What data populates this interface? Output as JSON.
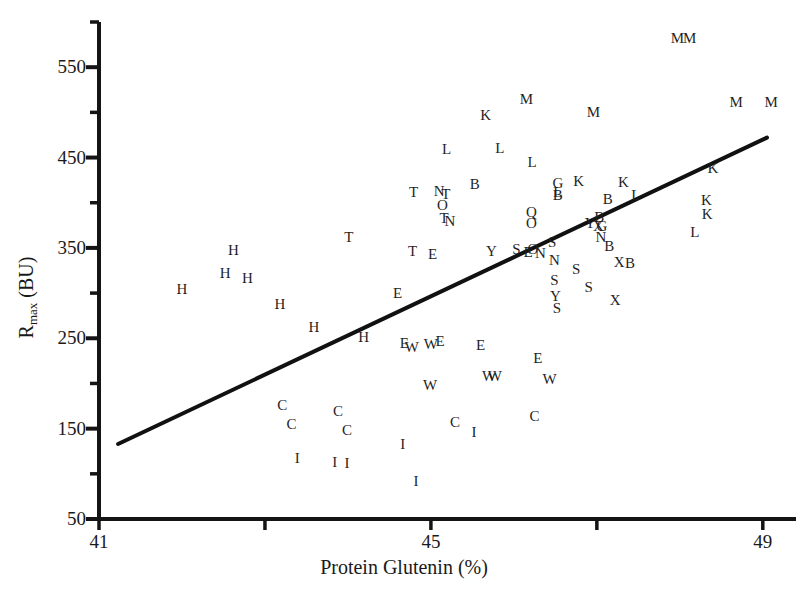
{
  "chart_data": {
    "type": "scatter",
    "title": "",
    "xlabel": "Protein Glutenin (%)",
    "ylabel": "R_max (BU)",
    "ylabel_base": "R",
    "ylabel_sub": "max",
    "ylabel_unit": " (BU)",
    "xlim": [
      41,
      49.4
    ],
    "ylim": [
      50,
      600
    ],
    "grid": false,
    "legend": "none",
    "point_marker": "letter-labels",
    "xticks": [
      41,
      43,
      45,
      47,
      49
    ],
    "xtick_labels": [
      "41",
      "",
      "45",
      "",
      "49"
    ],
    "yticks": [
      50,
      100,
      150,
      200,
      250,
      300,
      350,
      400,
      450,
      500,
      550,
      600
    ],
    "ytick_labels": [
      "50",
      "",
      "150",
      "",
      "250",
      "",
      "350",
      "",
      "450",
      "",
      "550",
      ""
    ],
    "trendline": {
      "x": [
        41.23,
        49.05
      ],
      "y": [
        133,
        472
      ],
      "style": "solid",
      "color": "#111111",
      "width": 4
    },
    "points": [
      {
        "label": "H",
        "x": 42.0,
        "y": 305
      },
      {
        "label": "H",
        "x": 42.52,
        "y": 322
      },
      {
        "label": "H",
        "x": 42.62,
        "y": 348
      },
      {
        "label": "H",
        "x": 42.79,
        "y": 317
      },
      {
        "label": "H",
        "x": 43.18,
        "y": 288
      },
      {
        "label": "H",
        "x": 43.59,
        "y": 262
      },
      {
        "label": "H",
        "x": 44.19,
        "y": 251
      },
      {
        "label": "E",
        "x": 44.6,
        "y": 300
      },
      {
        "label": "E",
        "x": 44.68,
        "y": 245
      },
      {
        "label": "E",
        "x": 45.11,
        "y": 247
      },
      {
        "label": "E",
        "x": 45.6,
        "y": 243
      },
      {
        "label": "E",
        "x": 45.02,
        "y": 343
      },
      {
        "label": "E",
        "x": 46.29,
        "y": 228
      },
      {
        "label": "E",
        "x": 46.17,
        "y": 345
      },
      {
        "label": "W",
        "x": 44.77,
        "y": 240
      },
      {
        "label": "W",
        "x": 45.0,
        "y": 244
      },
      {
        "label": "W",
        "x": 44.99,
        "y": 198
      },
      {
        "label": "W",
        "x": 45.7,
        "y": 208
      },
      {
        "label": "W",
        "x": 45.77,
        "y": 208
      },
      {
        "label": "W",
        "x": 46.43,
        "y": 205
      },
      {
        "label": "C",
        "x": 43.21,
        "y": 176
      },
      {
        "label": "C",
        "x": 43.32,
        "y": 155
      },
      {
        "label": "C",
        "x": 43.88,
        "y": 170
      },
      {
        "label": "C",
        "x": 43.99,
        "y": 148
      },
      {
        "label": "C",
        "x": 45.29,
        "y": 157
      },
      {
        "label": "C",
        "x": 46.25,
        "y": 164
      },
      {
        "label": "I",
        "x": 43.39,
        "y": 118
      },
      {
        "label": "I",
        "x": 43.84,
        "y": 113
      },
      {
        "label": "I",
        "x": 43.99,
        "y": 112
      },
      {
        "label": "I",
        "x": 44.66,
        "y": 133
      },
      {
        "label": "I",
        "x": 44.82,
        "y": 92
      },
      {
        "label": "I",
        "x": 45.52,
        "y": 146
      },
      {
        "label": "T",
        "x": 44.01,
        "y": 362
      },
      {
        "label": "T",
        "x": 44.79,
        "y": 412
      },
      {
        "label": "T",
        "x": 44.78,
        "y": 347
      },
      {
        "label": "T",
        "x": 45.18,
        "y": 410
      },
      {
        "label": "T",
        "x": 45.16,
        "y": 383
      },
      {
        "label": "N",
        "x": 45.1,
        "y": 413
      },
      {
        "label": "N",
        "x": 45.23,
        "y": 380
      },
      {
        "label": "O",
        "x": 45.14,
        "y": 398
      },
      {
        "label": "Y",
        "x": 45.73,
        "y": 347
      },
      {
        "label": "S",
        "x": 46.03,
        "y": 349
      },
      {
        "label": "O",
        "x": 46.21,
        "y": 378
      },
      {
        "label": "Q",
        "x": 46.21,
        "y": 390
      },
      {
        "label": "O",
        "x": 46.23,
        "y": 349
      },
      {
        "label": "N",
        "x": 46.32,
        "y": 344
      },
      {
        "label": "S",
        "x": 46.46,
        "y": 357
      },
      {
        "label": "N",
        "x": 46.49,
        "y": 337
      },
      {
        "label": "S",
        "x": 46.49,
        "y": 315
      },
      {
        "label": "Y",
        "x": 46.5,
        "y": 297
      },
      {
        "label": "S",
        "x": 46.52,
        "y": 283
      },
      {
        "label": "S",
        "x": 46.75,
        "y": 327
      },
      {
        "label": "S",
        "x": 46.9,
        "y": 307
      },
      {
        "label": "Y",
        "x": 46.92,
        "y": 378
      },
      {
        "label": "B",
        "x": 46.53,
        "y": 409
      },
      {
        "label": "B",
        "x": 47.03,
        "y": 384
      },
      {
        "label": "X",
        "x": 47.02,
        "y": 374
      },
      {
        "label": "G",
        "x": 47.06,
        "y": 374
      },
      {
        "label": "N",
        "x": 47.05,
        "y": 362
      },
      {
        "label": "B",
        "x": 47.15,
        "y": 352
      },
      {
        "label": "X",
        "x": 47.27,
        "y": 334
      },
      {
        "label": "B",
        "x": 47.4,
        "y": 333
      },
      {
        "label": "X",
        "x": 47.22,
        "y": 292
      },
      {
        "label": "B",
        "x": 45.53,
        "y": 421
      },
      {
        "label": "G",
        "x": 46.53,
        "y": 422
      },
      {
        "label": "L",
        "x": 45.19,
        "y": 459
      },
      {
        "label": "L",
        "x": 45.83,
        "y": 461
      },
      {
        "label": "L",
        "x": 46.22,
        "y": 445
      },
      {
        "label": "K",
        "x": 45.66,
        "y": 497
      },
      {
        "label": "M",
        "x": 46.15,
        "y": 515
      },
      {
        "label": "M",
        "x": 46.96,
        "y": 500
      },
      {
        "label": "M",
        "x": 47.97,
        "y": 582
      },
      {
        "label": "M",
        "x": 48.12,
        "y": 582
      },
      {
        "label": "M",
        "x": 48.68,
        "y": 512
      },
      {
        "label": "M",
        "x": 49.1,
        "y": 512
      },
      {
        "label": "K",
        "x": 46.78,
        "y": 424
      },
      {
        "label": "K",
        "x": 47.32,
        "y": 423
      },
      {
        "label": "L",
        "x": 46.53,
        "y": 412
      },
      {
        "label": "B",
        "x": 47.13,
        "y": 404
      },
      {
        "label": "L",
        "x": 47.47,
        "y": 408
      },
      {
        "label": "K",
        "x": 48.4,
        "y": 438
      },
      {
        "label": "L",
        "x": 48.18,
        "y": 368
      },
      {
        "label": "K",
        "x": 48.32,
        "y": 403
      },
      {
        "label": "K",
        "x": 48.33,
        "y": 388
      }
    ]
  },
  "axes": {
    "x_axis_label": "Protein Glutenin (%)",
    "y_axis_label": "R max (BU)"
  }
}
